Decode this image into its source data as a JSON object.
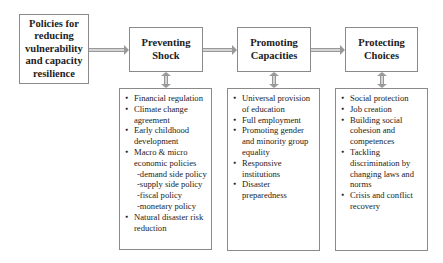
{
  "diagram": {
    "root": {
      "label": "Policies for reducing vulnerability and capacity resilience"
    },
    "stages": [
      {
        "title": "Preventing Shock",
        "items": [
          {
            "text": "Financial regulation"
          },
          {
            "text": "Climate change agreement"
          },
          {
            "text": "Early childhood development"
          },
          {
            "text": "Macro & micro economic policies",
            "sub": [
              "-demand side policy",
              "-supply side policy",
              "-fiscal policy",
              "-monetary policy"
            ]
          },
          {
            "text": "Natural disaster risk reduction"
          }
        ]
      },
      {
        "title": "Promoting Capacities",
        "items": [
          {
            "text": "Universal provision of education"
          },
          {
            "text": "Full employment"
          },
          {
            "text": "Promoting gender and minority group equality"
          },
          {
            "text": "Responsive institutions"
          },
          {
            "text": "Disaster preparedness"
          }
        ]
      },
      {
        "title": "Protecting Choices",
        "items": [
          {
            "text": "Social protection"
          },
          {
            "text": "Job creation"
          },
          {
            "text": "Building social cohesion and competences"
          },
          {
            "text": "Tackling discrimination by changing laws and norms"
          },
          {
            "text": "Crisis and conflict recovery"
          }
        ]
      }
    ]
  }
}
